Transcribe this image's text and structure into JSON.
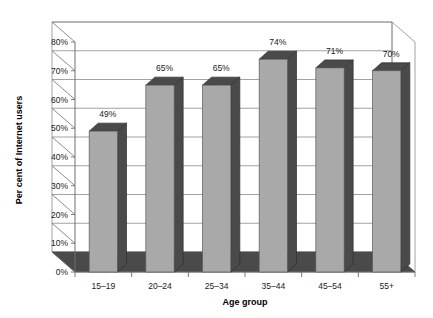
{
  "chart_data": {
    "type": "bar",
    "title": "",
    "subtitle": "",
    "xlabel": "Age group",
    "ylabel": "Per cent of Internet users",
    "categories": [
      "15–19",
      "20–24",
      "25–34",
      "35–44",
      "45–54",
      "55+"
    ],
    "values": [
      49,
      65,
      65,
      74,
      71,
      70
    ],
    "value_labels": [
      "49%",
      "65%",
      "65%",
      "74%",
      "71%",
      "70%"
    ],
    "ylim": [
      0,
      80
    ],
    "yticks": [
      0,
      10,
      20,
      30,
      40,
      50,
      60,
      70,
      80
    ],
    "ytick_labels": [
      "0%",
      "10%",
      "20%",
      "30%",
      "40%",
      "50%",
      "60%",
      "70%",
      "80%"
    ],
    "grid": true,
    "legend": false,
    "legend_position": "none",
    "three_d": true,
    "series": [
      {
        "name": "Per cent of Internet users",
        "values": [
          49,
          65,
          65,
          74,
          71,
          70
        ]
      }
    ]
  },
  "style": {
    "background_color": "#ffffff",
    "bar_front_color": "#a9a9a9",
    "bar_side_color": "#4a4a4a",
    "bar_top_color": "#4a4a4a",
    "floor_color": "#4a4a4a",
    "gridline_color": "#8c8c8c",
    "axis_color": "#6e6e6e",
    "text_color": "#1a1a1a"
  },
  "icons": {
    "chart_icon": "bar-chart-icon"
  }
}
